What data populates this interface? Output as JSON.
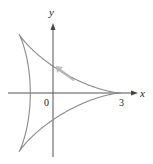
{
  "figure": {
    "type": "parametric-curve",
    "curve_name": "deltoid",
    "axes": {
      "x_label": "x",
      "y_label": "y",
      "origin_label": "0",
      "x_tick_label": "3"
    },
    "cusps": [
      [
        3,
        0
      ],
      [
        -1.5,
        2.598
      ],
      [
        -1.5,
        -2.598
      ]
    ],
    "direction_arrow": "counterclockwise (up-left along upper branch)",
    "colors": {
      "curve": "#8a8a8a",
      "axes": "#555555",
      "arrow": "#b0b0b0",
      "text": "#222222"
    }
  }
}
